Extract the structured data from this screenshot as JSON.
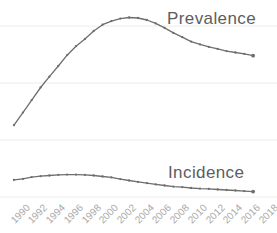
{
  "chart": {
    "colors": {
      "line": "#6e6e6e",
      "marker": "#6e6e6e",
      "series_label": "#5d5d5d",
      "tick_label": "#a9a9a9",
      "gridline": "#ececec",
      "background": "#ffffff"
    }
  },
  "chart_data": {
    "type": "line",
    "title": "",
    "xlabel": "",
    "ylabel": "",
    "x": [
      1990,
      1991,
      1992,
      1993,
      1994,
      1995,
      1996,
      1997,
      1998,
      1999,
      2000,
      2001,
      2002,
      2003,
      2004,
      2005,
      2006,
      2007,
      2008,
      2009,
      2010,
      2011,
      2012,
      2013,
      2014,
      2015,
      2016,
      2017
    ],
    "x_tick_labels": [
      "1990",
      "1992",
      "1994",
      "1996",
      "1998",
      "2000",
      "2002",
      "2004",
      "2006",
      "2008",
      "2010",
      "2012",
      "2014",
      "2016",
      "2018"
    ],
    "xlim": [
      1990,
      2018
    ],
    "ylim": [
      0,
      107
    ],
    "grid": true,
    "y_axis_hidden": true,
    "legend_position": "inline-labels-at-line",
    "units": "relative scale: 0 = bottom gridline, 100 = prevalence peak",
    "series": [
      {
        "name": "Prevalence",
        "values": [
          40,
          47,
          54,
          61,
          67,
          73,
          79,
          84,
          88,
          92.5,
          96,
          98,
          99.4,
          100,
          99.7,
          98.6,
          96.7,
          94.2,
          91.4,
          89,
          86.6,
          85,
          83.6,
          82.5,
          81.3,
          80.5,
          79.7,
          78.7
        ]
      },
      {
        "name": "Incidence",
        "values": [
          9.5,
          10.1,
          11.1,
          11.6,
          12,
          12.3,
          12.5,
          12.5,
          12.3,
          12,
          11.4,
          10.9,
          10,
          9.2,
          8.4,
          7.7,
          7,
          6.4,
          5.8,
          5.5,
          5,
          4.7,
          4.5,
          4.2,
          3.9,
          3.6,
          3.3,
          3
        ]
      }
    ]
  }
}
